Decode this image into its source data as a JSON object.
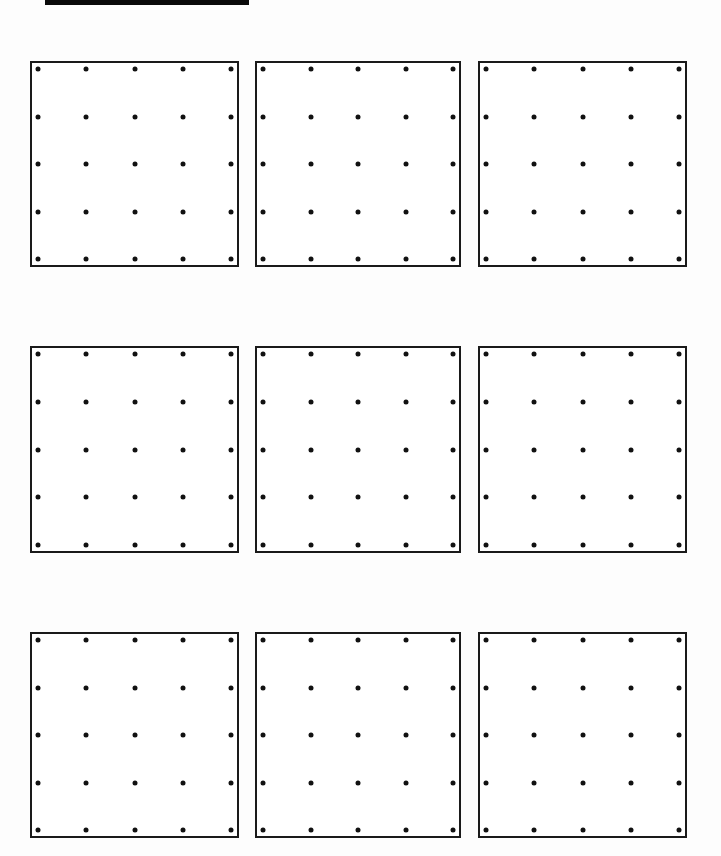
{
  "page": {
    "type": "geoboard-worksheet",
    "header_bar": {
      "color": "#0a0a0a"
    },
    "grid": {
      "rows": 3,
      "cols": 3
    },
    "boards": [
      {
        "row": 0,
        "col": 0,
        "dots_per_side": 5
      },
      {
        "row": 0,
        "col": 1,
        "dots_per_side": 5
      },
      {
        "row": 0,
        "col": 2,
        "dots_per_side": 5
      },
      {
        "row": 1,
        "col": 0,
        "dots_per_side": 5
      },
      {
        "row": 1,
        "col": 1,
        "dots_per_side": 5
      },
      {
        "row": 1,
        "col": 2,
        "dots_per_side": 5
      },
      {
        "row": 2,
        "col": 0,
        "dots_per_side": 5
      },
      {
        "row": 2,
        "col": 1,
        "dots_per_side": 5
      },
      {
        "row": 2,
        "col": 2,
        "dots_per_side": 5
      }
    ],
    "colors": {
      "border": "#1a1a1a",
      "dot": "#111111",
      "background": "#ffffff"
    }
  }
}
